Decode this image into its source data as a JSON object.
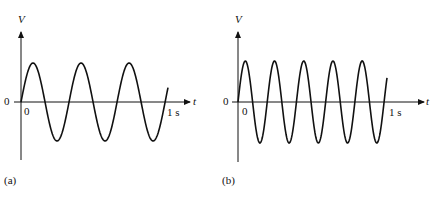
{
  "panels": [
    {
      "id": "a",
      "caption": "(a)",
      "y_axis_label": "V",
      "x_axis_label": "t",
      "origin_left_label": "0",
      "origin_below_label": "0",
      "end_time_label": "1 s",
      "cycles": 3
    },
    {
      "id": "b",
      "caption": "(b)",
      "y_axis_label": "V",
      "x_axis_label": "t",
      "origin_left_label": "0",
      "origin_below_label": "0",
      "end_time_label": "1 s",
      "cycles": 5
    }
  ],
  "chart_data": [
    {
      "type": "line",
      "title": "(a)",
      "xlabel": "t",
      "ylabel": "V",
      "x_range": [
        0,
        1
      ],
      "x_unit": "s",
      "waveform": "sine",
      "cycles_in_1s": 3,
      "frequency_hz": 3
    },
    {
      "type": "line",
      "title": "(b)",
      "xlabel": "t",
      "ylabel": "V",
      "x_range": [
        0,
        1
      ],
      "x_unit": "s",
      "waveform": "sine",
      "cycles_in_1s": 5,
      "frequency_hz": 5
    }
  ]
}
